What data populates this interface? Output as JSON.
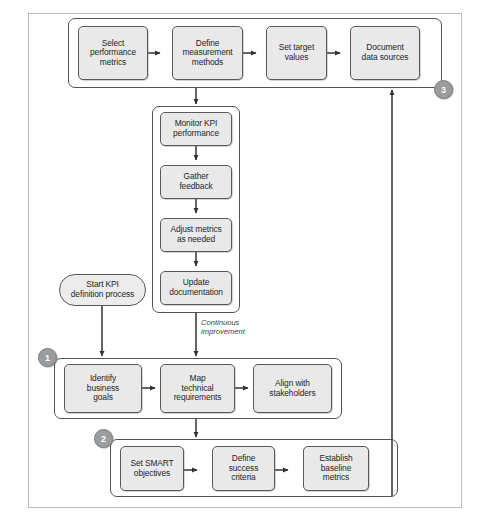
{
  "figure": {
    "type": "flowchart",
    "top_caption_fragment": "",
    "bottom_caption_fragment": "",
    "background_color": "#ffffff",
    "node_fill": "#e9e9e9",
    "node_border": "#555a5d",
    "badge_color": "#9a9c9e",
    "line_color": "#2f3335"
  },
  "badges": [
    {
      "id": "badge-1",
      "label": "1"
    },
    {
      "id": "badge-2",
      "label": "2"
    },
    {
      "id": "badge-3",
      "label": "3"
    }
  ],
  "terminator": {
    "label": "Start KPI\ndefinition process",
    "line1": "Start KPI",
    "line2": "definition process"
  },
  "groups": [
    {
      "id": "group-3",
      "badge": "3",
      "nodes": [
        {
          "id": "select-performance-metrics",
          "line1": "Select",
          "line2": "performance",
          "line3": "metrics"
        },
        {
          "id": "define-measurement-methods",
          "line1": "Define",
          "line2": "measurement",
          "line3": "methods"
        },
        {
          "id": "set-target-values",
          "line1": "Set target",
          "line2": "values",
          "line3": ""
        },
        {
          "id": "document-data-sources",
          "line1": "Document",
          "line2": "data sources",
          "line3": ""
        }
      ]
    },
    {
      "id": "group-monitor",
      "badge": "",
      "nodes": [
        {
          "id": "monitor-kpi-performance",
          "line1": "Monitor KPI",
          "line2": "performance",
          "line3": ""
        },
        {
          "id": "gather-feedback",
          "line1": "Gather",
          "line2": "feedback",
          "line3": ""
        },
        {
          "id": "adjust-metrics-as-needed",
          "line1": "Adjust metrics",
          "line2": "as needed",
          "line3": ""
        },
        {
          "id": "update-documentation",
          "line1": "Update",
          "line2": "documentation",
          "line3": ""
        }
      ]
    },
    {
      "id": "group-1",
      "badge": "1",
      "nodes": [
        {
          "id": "identify-business-goals",
          "line1": "Identify",
          "line2": "business",
          "line3": "goals"
        },
        {
          "id": "map-technical-requirements",
          "line1": "Map",
          "line2": "technical",
          "line3": "requirements"
        },
        {
          "id": "align-with-stakeholders",
          "line1": "Align with",
          "line2": "stakeholders",
          "line3": ""
        }
      ]
    },
    {
      "id": "group-2",
      "badge": "2",
      "nodes": [
        {
          "id": "set-smart-objectives",
          "line1": "Set SMART",
          "line2": "objectives",
          "line3": ""
        },
        {
          "id": "define-success-criteria",
          "line1": "Define",
          "line2": "success",
          "line3": "criteria"
        },
        {
          "id": "establish-baseline-metrics",
          "line1": "Establish",
          "line2": "baseline",
          "line3": "metrics"
        }
      ]
    }
  ],
  "annotations": {
    "continuous_improvement_line1": "Continuous",
    "continuous_improvement_line2": "improvement"
  }
}
